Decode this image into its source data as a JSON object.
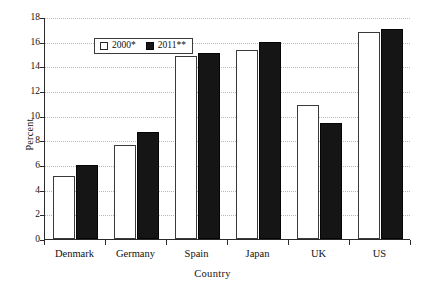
{
  "chart_data": {
    "type": "bar",
    "title": "",
    "subtitle": "",
    "xlabel": "Country",
    "ylabel": "Percent",
    "categories": [
      "Denmark",
      "Germany",
      "Spain",
      "Japan",
      "UK",
      "US"
    ],
    "series": [
      {
        "name": "2000*",
        "color": "#ffffff",
        "values": [
          5.1,
          7.6,
          14.8,
          15.3,
          10.9,
          16.8
        ]
      },
      {
        "name": "2011**",
        "color": "#151515",
        "values": [
          6.0,
          8.7,
          15.05,
          16.0,
          9.4,
          17.0
        ]
      }
    ],
    "ylim": [
      0,
      18
    ],
    "yticks": [
      0,
      2,
      4,
      6,
      8,
      10,
      12,
      14,
      16,
      18
    ],
    "ytick_labels": [
      "0",
      "2",
      "4",
      "6",
      "8",
      "10",
      "12",
      "14",
      "16",
      "18"
    ],
    "grid": true,
    "grid_axis": "y",
    "grid_style": "dotted",
    "grid_color": "#b9b9b9",
    "legend_position": "upper-left",
    "legend_entries": [
      "2000*",
      "2011**"
    ],
    "axis_color": "#2b2b2b",
    "background": "#ffffff"
  }
}
